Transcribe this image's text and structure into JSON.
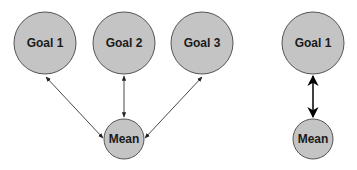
{
  "left_diagram": {
    "goals": [
      {
        "label": "Goal 1",
        "cx": 45,
        "cy": 43,
        "r": 31
      },
      {
        "label": "Goal 2",
        "cx": 124,
        "cy": 43,
        "r": 31
      },
      {
        "label": "Goal 3",
        "cx": 202,
        "cy": 43,
        "r": 31
      }
    ],
    "mean": {
      "label": "Mean",
      "cx": 124,
      "cy": 139,
      "r": 20
    },
    "edge_style": "thin bidirectional arrows"
  },
  "right_diagram": {
    "goal": {
      "label": "Goal 1",
      "cx": 313,
      "cy": 43,
      "r": 31
    },
    "mean": {
      "label": "Mean",
      "cx": 313,
      "cy": 139,
      "r": 20
    },
    "edge_style": "thick bidirectional arrow"
  },
  "colors": {
    "node_fill": "#c4c4c4",
    "node_stroke": "#555555",
    "text": "#1a1a1a",
    "arrow": "#222222"
  }
}
